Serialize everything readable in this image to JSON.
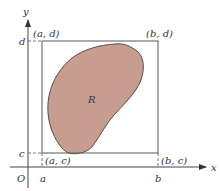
{
  "figure": {
    "type": "region-in-rectangle",
    "axes": {
      "x_label": "x",
      "y_label": "y",
      "origin_label": "O",
      "x_ticks": [
        "a",
        "b"
      ],
      "y_ticks": [
        "c",
        "d"
      ]
    },
    "corners": {
      "top_left": "(a, d)",
      "top_right": "(b, d)",
      "bottom_left": "(a, c)",
      "bottom_right": "(b, c)"
    },
    "region": {
      "label": "R",
      "fill_color": "#c79d90",
      "stroke_color": "#5a4a46"
    },
    "colors": {
      "axis": "#444444",
      "rectangle": "#666666",
      "dashed": "#555555"
    }
  }
}
